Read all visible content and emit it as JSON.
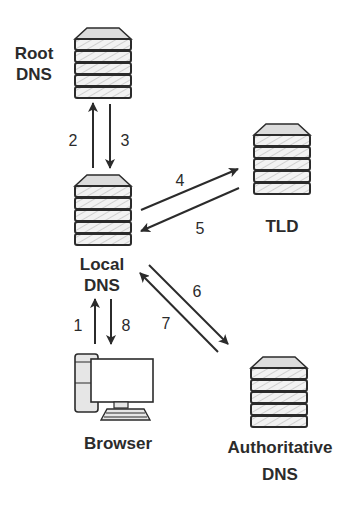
{
  "diagram": {
    "type": "DNS resolution flow",
    "colors": {
      "stroke": "#2b2b2b",
      "server_fill": "#f2f2f2",
      "server_cap_fill": "#dcdcdc",
      "hatch": "#cfcfcf",
      "computer_fill": "#e6e6e6",
      "background": "#ffffff"
    },
    "nodes": {
      "root": {
        "label_line1": "Root",
        "label_line2": "DNS",
        "icon": "server-stack-icon"
      },
      "local": {
        "label_line1": "Local",
        "label_line2": "DNS",
        "icon": "server-stack-icon"
      },
      "tld": {
        "label_line1": "TLD",
        "icon": "server-stack-icon"
      },
      "authoritative": {
        "label_line1": "Authoritative",
        "label_line2": "DNS",
        "icon": "server-stack-icon"
      },
      "browser": {
        "label_line1": "Browser",
        "icon": "desktop-computer-icon"
      }
    },
    "edges": [
      {
        "step": "1",
        "from": "Browser",
        "to": "Local DNS"
      },
      {
        "step": "2",
        "from": "Local DNS",
        "to": "Root DNS"
      },
      {
        "step": "3",
        "from": "Root DNS",
        "to": "Local DNS"
      },
      {
        "step": "4",
        "from": "Local DNS",
        "to": "TLD"
      },
      {
        "step": "5",
        "from": "TLD",
        "to": "Local DNS"
      },
      {
        "step": "6",
        "from": "Local DNS",
        "to": "Authoritative DNS"
      },
      {
        "step": "7",
        "from": "Authoritative DNS",
        "to": "Local DNS"
      },
      {
        "step": "8",
        "from": "Local DNS",
        "to": "Browser"
      }
    ]
  }
}
